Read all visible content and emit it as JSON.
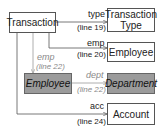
{
  "diagram": {
    "nodes": {
      "transaction": {
        "label": "Transaction",
        "shaded": false
      },
      "transaction_type": {
        "label": "Transaction Type",
        "line1": "Transaction",
        "line2": "Type",
        "shaded": false
      },
      "employee_right": {
        "label": "Employee",
        "shaded": false
      },
      "employee_shaded": {
        "label": "Employee",
        "shaded": true
      },
      "department": {
        "label": "Department",
        "shaded": true
      },
      "account": {
        "label": "Account",
        "shaded": false
      }
    },
    "edges": [
      {
        "from": "Transaction",
        "to": "Transaction Type",
        "name": "type",
        "line": "(line 19)"
      },
      {
        "from": "Transaction",
        "to": "Employee",
        "name": "emp",
        "line": "(line 20)"
      },
      {
        "from": "Transaction",
        "to": "Employee",
        "name": "emp",
        "line": "(line 22)",
        "style": "gray-italic"
      },
      {
        "from": "Employee",
        "to": "Department",
        "name": "dept",
        "line": "(line 22)",
        "style": "gray-italic"
      },
      {
        "from": "Transaction",
        "to": "Account",
        "name": "acc",
        "line": "(line 24)"
      }
    ],
    "colors": {
      "shaded_fill": "#9b9b9b",
      "line": "#555555",
      "gray_line": "#999999"
    }
  }
}
